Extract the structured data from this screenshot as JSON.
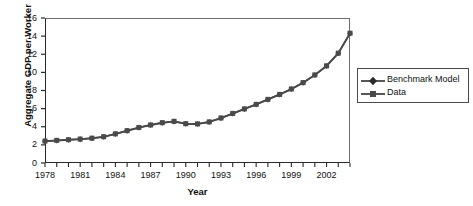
{
  "chart_data": {
    "type": "line",
    "title": "",
    "xlabel": "Year",
    "ylabel": "Aggregate GDP per Worker",
    "xlim": [
      1978,
      2004
    ],
    "ylim": [
      0,
      16
    ],
    "ytick_step": 2,
    "xtick_step": 1,
    "xtick_label_step": 3,
    "grid": false,
    "legend_position": "right",
    "yticks": [
      "0",
      "2",
      "4",
      "6",
      "8",
      "10",
      "12",
      "14",
      "16"
    ],
    "xticks": [
      "1978",
      "1981",
      "1984",
      "1987",
      "1990",
      "1993",
      "1996",
      "1999",
      "2002"
    ],
    "x": [
      1978,
      1979,
      1980,
      1981,
      1982,
      1983,
      1984,
      1985,
      1986,
      1987,
      1988,
      1989,
      1990,
      1991,
      1992,
      1993,
      1994,
      1995,
      1996,
      1997,
      1998,
      1999,
      2000,
      2001,
      2002,
      2003,
      2004
    ],
    "series": [
      {
        "name": "Benchmark Model",
        "marker": "diamond",
        "color": "#3a3a3a",
        "values": [
          2.4,
          2.48,
          2.55,
          2.62,
          2.72,
          2.88,
          3.2,
          3.55,
          3.9,
          4.18,
          4.42,
          4.58,
          4.32,
          4.3,
          4.52,
          4.95,
          5.45,
          5.95,
          6.45,
          7.0,
          7.55,
          8.15,
          8.85,
          9.7,
          10.7,
          12.1,
          14.3
        ]
      },
      {
        "name": "Data",
        "marker": "square",
        "color": "#4a4a4a",
        "values": [
          2.42,
          2.5,
          2.57,
          2.64,
          2.74,
          2.9,
          3.22,
          3.57,
          3.92,
          4.2,
          4.45,
          4.6,
          4.34,
          4.32,
          4.54,
          4.97,
          5.47,
          5.97,
          6.47,
          7.02,
          7.57,
          8.17,
          8.87,
          9.72,
          10.72,
          12.12,
          14.32
        ]
      }
    ]
  },
  "legend": {
    "entries": [
      {
        "label": "Benchmark Model"
      },
      {
        "label": "Data"
      }
    ]
  }
}
